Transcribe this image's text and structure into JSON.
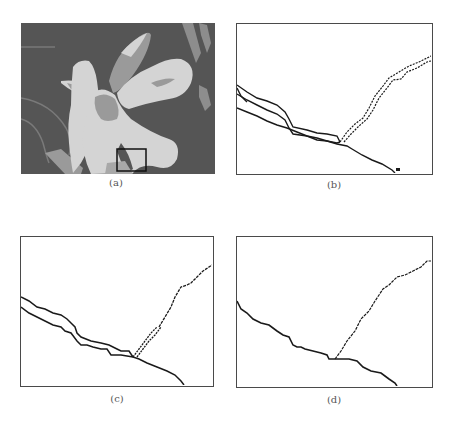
{
  "figure": {
    "panels": [
      {
        "id": "a",
        "label": "(a)",
        "description": "segmented flower image with highlighted region box"
      },
      {
        "id": "b",
        "label": "(b)",
        "description": "boundary contours of highlighted region, multiple overlapping edges"
      },
      {
        "id": "c",
        "label": "(c)",
        "description": "boundary contours after partial merging"
      },
      {
        "id": "d",
        "label": "(d)",
        "description": "final single-pixel boundary contours"
      }
    ]
  },
  "colors": {
    "background_dark": "#555555",
    "petal_light": "#d4d4d4",
    "petal_mid": "#9a9a9a",
    "line": "#1a1a1a",
    "frame": "#4a4a4a"
  }
}
